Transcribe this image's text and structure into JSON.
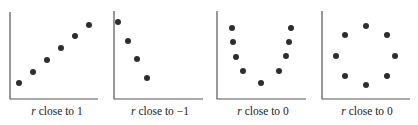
{
  "chart_data": [
    {
      "type": "scatter",
      "title": "",
      "caption_var": "r",
      "caption_rest": " close to 1",
      "xlabel": "",
      "ylabel": "",
      "grid": false,
      "axes_box": {
        "x0": 10,
        "y_top": 12,
        "y0": 99,
        "x1": 98
      },
      "points": [
        [
          19,
          83
        ],
        [
          33,
          72
        ],
        [
          47,
          60
        ],
        [
          61,
          48
        ],
        [
          75,
          36
        ],
        [
          89,
          25
        ]
      ]
    },
    {
      "type": "scatter",
      "title": "",
      "caption_var": "r",
      "caption_rest": " close to −1",
      "xlabel": "",
      "ylabel": "",
      "grid": false,
      "axes_box": {
        "x0": 114,
        "y_top": 11,
        "y0": 99,
        "x1": 203
      },
      "points": [
        [
          118,
          22
        ],
        [
          128,
          41
        ],
        [
          137,
          59
        ],
        [
          147,
          78
        ]
      ]
    },
    {
      "type": "scatter",
      "title": "",
      "caption_var": "r",
      "caption_rest": " close to 0",
      "xlabel": "",
      "ylabel": "",
      "grid": false,
      "axes_box": {
        "x0": 217,
        "y_top": 11,
        "y0": 99,
        "x1": 306
      },
      "points": [
        [
          232,
          28
        ],
        [
          233,
          42
        ],
        [
          236,
          57
        ],
        [
          243,
          71
        ],
        [
          261,
          83
        ],
        [
          279,
          71
        ],
        [
          286,
          56
        ],
        [
          289,
          42
        ],
        [
          291,
          28
        ]
      ]
    },
    {
      "type": "scatter",
      "title": "",
      "caption_var": "r",
      "caption_rest": " close to 0",
      "xlabel": "",
      "ylabel": "",
      "grid": false,
      "axes_box": {
        "x0": 322,
        "y_top": 11,
        "y0": 99,
        "x1": 410
      },
      "points": [
        [
          366,
          26
        ],
        [
          345,
          35
        ],
        [
          387,
          35
        ],
        [
          336,
          56
        ],
        [
          395,
          56
        ],
        [
          345,
          76
        ],
        [
          387,
          76
        ],
        [
          366,
          85
        ]
      ]
    }
  ],
  "colors": {
    "axis": "#555555",
    "dot": "#2e2e2e",
    "text": "#222222"
  },
  "dot_radius": 3
}
